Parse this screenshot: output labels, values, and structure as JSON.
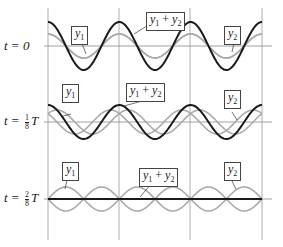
{
  "rows": [
    {
      "label_prefix": "t = ",
      "label_value": "0",
      "frac_num": "",
      "frac_den": "",
      "label_suffix": ""
    },
    {
      "label_prefix": "t = ",
      "label_value": "",
      "frac_num": "1",
      "frac_den": "8",
      "label_suffix": "T"
    },
    {
      "label_prefix": "t = ",
      "label_value": "",
      "frac_num": "2",
      "frac_den": "8",
      "label_suffix": "T"
    }
  ],
  "tags": {
    "y1": {
      "base": "y",
      "sub": "1"
    },
    "y2": {
      "base": "y",
      "sub": "2"
    },
    "sum": {
      "base1": "y",
      "sub1": "1",
      "plus": " + ",
      "base2": "y",
      "sub2": "2"
    }
  },
  "colors": {
    "sum_curve": "#1a1a1a",
    "component_curve": "#aaaaaa",
    "axis": "#888888",
    "gridline": "#999999"
  },
  "chart_data": {
    "type": "line",
    "title": "",
    "xlabel": "",
    "ylabel": "",
    "periods_shown": 3,
    "panels": [
      {
        "time": "t = 0",
        "y1_amplitude": 1,
        "y2_amplitude": 1,
        "sum_amplitude": 2,
        "phase_offset_fraction": 0
      },
      {
        "time": "t = T/8",
        "y1_amplitude": 1,
        "y2_amplitude": 1,
        "sum_amplitude": 1.414,
        "phase_offset_fraction": 0.125
      },
      {
        "time": "t = 2T/8",
        "y1_amplitude": 1,
        "y2_amplitude": 1,
        "sum_amplitude": 0,
        "phase_offset_fraction": 0.25
      }
    ],
    "legend": [
      "y1",
      "y2",
      "y1 + y2"
    ]
  }
}
